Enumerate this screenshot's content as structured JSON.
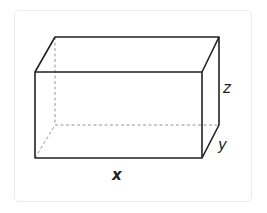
{
  "diagram": {
    "type": "rectangular-prism",
    "labels": {
      "length": "x",
      "depth": "y",
      "height": "z"
    },
    "colors": {
      "edge": "#222222",
      "hidden_edge": "#999999",
      "card_border": "#ececec",
      "background": "#ffffff"
    },
    "vertices": {
      "front_top_left": [
        35,
        72
      ],
      "front_top_right": [
        202,
        72
      ],
      "front_bottom_left": [
        35,
        158
      ],
      "front_bottom_right": [
        202,
        158
      ],
      "back_top_left": [
        55,
        37
      ],
      "back_top_right": [
        219,
        37
      ],
      "back_bottom_left": [
        55,
        125
      ],
      "back_bottom_right": [
        219,
        125
      ]
    }
  }
}
